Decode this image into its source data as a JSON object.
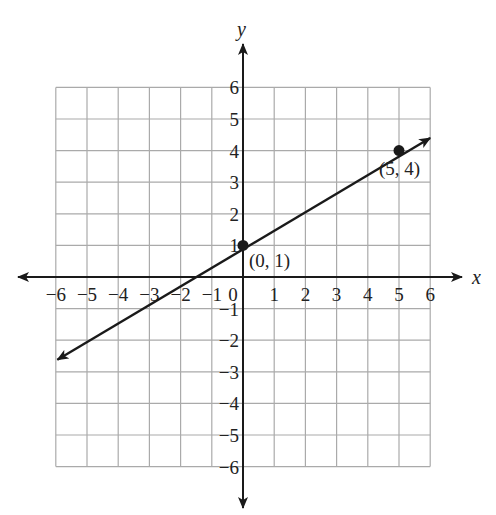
{
  "chart_data": {
    "type": "line",
    "title": "",
    "xlabel": "x",
    "ylabel": "y",
    "xlim": [
      -6,
      6
    ],
    "ylim": [
      -6,
      6
    ],
    "grid": true,
    "x_ticks": [
      "−6",
      "−5",
      "−4",
      "−3",
      "−2",
      "−1",
      "0",
      "1",
      "2",
      "3",
      "4",
      "5",
      "6"
    ],
    "y_ticks": [
      "6",
      "5",
      "4",
      "3",
      "2",
      "1",
      "−1",
      "−2",
      "−3",
      "−4",
      "−5",
      "−6"
    ],
    "line": {
      "slope": 0.6,
      "intercept": 1,
      "equation": "y = (3/5)x + 1",
      "x_range": [
        -6,
        6
      ]
    },
    "points": [
      {
        "x": 0,
        "y": 1,
        "label": "(0, 1)"
      },
      {
        "x": 5,
        "y": 4,
        "label": "(5, 4)"
      }
    ]
  },
  "labels": {
    "x_axis": "x",
    "y_axis": "y",
    "point_a": "(0, 1)",
    "point_b": "(5, 4)"
  }
}
